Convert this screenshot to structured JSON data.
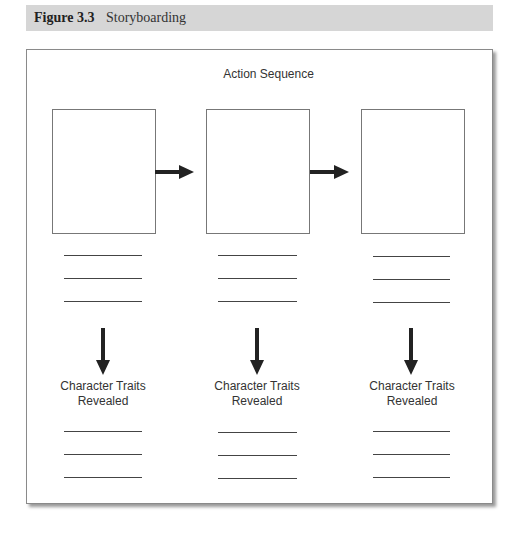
{
  "figure": {
    "number_label": "Figure 3.3",
    "title": "Storyboarding"
  },
  "diagram": {
    "top_label": "Action Sequence",
    "panels": [
      {
        "label_line1": "Character Traits",
        "label_line2": "Revealed"
      },
      {
        "label_line1": "Character Traits",
        "label_line2": "Revealed"
      },
      {
        "label_line1": "Character Traits",
        "label_line2": "Revealed"
      }
    ],
    "arrow_color": "#222222"
  }
}
